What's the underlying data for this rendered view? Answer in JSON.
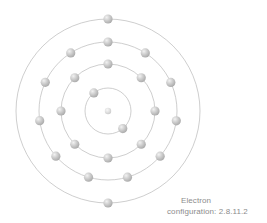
{
  "figure": {
    "center": {
      "x": 108,
      "y": 111
    },
    "ring_color": "#b9b9b9",
    "electron_color": "#b0b0b0",
    "electron_highlight_color": "#e8e8e8",
    "electron_radius": 4.6,
    "background_color": "#ffffff",
    "nucleus": {
      "label": "nucleus",
      "radius": 3.2,
      "color": "#cfcfcf"
    },
    "shells": [
      {
        "name": "shell-1",
        "radius": 23,
        "electron_count": 2,
        "angles": [
          128,
          310
        ]
      },
      {
        "name": "shell-2",
        "radius": 47,
        "electron_count": 8,
        "angles": [
          90,
          135,
          180,
          225,
          270,
          315,
          0,
          45
        ]
      },
      {
        "name": "shell-3",
        "radius": 69,
        "electron_count": 11,
        "angles": [
          90,
          122.7,
          155.4,
          188.1,
          220.9,
          253.6,
          286.4,
          319.1,
          351.8,
          24.5,
          57.3
        ]
      },
      {
        "name": "shell-4",
        "radius": 92,
        "electron_count": 2,
        "angles": [
          90,
          270
        ]
      }
    ]
  },
  "caption": {
    "line1": "Electron",
    "line2": "configuration: 2.8.11.2",
    "color": "#8c8c8c"
  },
  "chart_data": {
    "type": "diagram",
    "title": "Electron configuration: 2.8.11.2",
    "shell_labels": [
      "K",
      "L",
      "M",
      "N"
    ],
    "electrons_per_shell": [
      2,
      8,
      11,
      2
    ],
    "total_electrons": 23
  }
}
